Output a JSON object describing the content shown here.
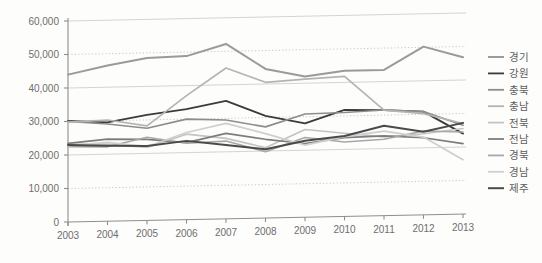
{
  "chart_data": {
    "type": "line",
    "title": "",
    "xlabel": "",
    "ylabel": "",
    "x": [
      "2003",
      "2004",
      "2005",
      "2006",
      "2007",
      "2008",
      "2009",
      "2010",
      "2011",
      "2012",
      "2013"
    ],
    "categories": [
      "2003",
      "2004",
      "2005",
      "2006",
      "2007",
      "2008",
      "2009",
      "2010",
      "2011",
      "2012",
      "2013"
    ],
    "ylim": [
      0,
      60000
    ],
    "ytick_values": [
      0,
      10000,
      20000,
      30000,
      40000,
      50000,
      60000
    ],
    "ytick_labels": [
      "0",
      "10,000",
      "20,000",
      "30,000",
      "40,000",
      "50,000",
      "60,000"
    ],
    "grid": true,
    "grid_note": "horizontal gridlines only; alternating solid and dotted",
    "legend_position": "right",
    "series": [
      {
        "name": "경기",
        "color": "#9a9a9a",
        "width": 2.0,
        "values": [
          44000,
          46500,
          48500,
          48800,
          52200,
          44500,
          42000,
          43500,
          43500,
          50200,
          46800
        ]
      },
      {
        "name": "강원",
        "color": "#3b3b3b",
        "width": 1.8,
        "values": [
          30200,
          29500,
          31500,
          33000,
          35200,
          30500,
          28000,
          31800,
          31500,
          30800,
          24000
        ]
      },
      {
        "name": "충북",
        "color": "#8d8d8d",
        "width": 1.6,
        "values": [
          30000,
          29000,
          27500,
          30000,
          29500,
          27200,
          30800,
          31000,
          31500,
          30800,
          26500
        ]
      },
      {
        "name": "충남",
        "color": "#b4b4b4",
        "width": 1.7,
        "values": [
          29800,
          30200,
          28200,
          37000,
          45000,
          40500,
          41200,
          41800,
          31500,
          30200,
          27000
        ]
      },
      {
        "name": "전북",
        "color": "#c4c4c4",
        "width": 1.6,
        "values": [
          23200,
          23000,
          21800,
          25500,
          24000,
          21000,
          26200,
          24800,
          23500,
          24200,
          25500
        ]
      },
      {
        "name": "전남",
        "color": "#7d7d7d",
        "width": 1.7,
        "values": [
          23500,
          24500,
          24200,
          23000,
          25500,
          23500,
          22000,
          23500,
          23800,
          23000,
          21000
        ]
      },
      {
        "name": "경북",
        "color": "#a8a8a8",
        "width": 1.6,
        "values": [
          22500,
          22200,
          24800,
          22800,
          23200,
          19800,
          23800,
          22200,
          22800,
          25000,
          24500
        ]
      },
      {
        "name": "경남",
        "color": "#cfcfcf",
        "width": 1.7,
        "values": [
          22800,
          23500,
          22000,
          26000,
          28500,
          25200,
          21500,
          23800,
          25200,
          23200,
          16200
        ]
      },
      {
        "name": "제주",
        "color": "#4a4a4a",
        "width": 2.0,
        "values": [
          23000,
          22500,
          22200,
          23500,
          22000,
          20500,
          22800,
          24000,
          26800,
          24800,
          27200
        ]
      }
    ]
  },
  "legend": {
    "items": [
      {
        "label": "경기"
      },
      {
        "label": "강원"
      },
      {
        "label": "충북"
      },
      {
        "label": "충남"
      },
      {
        "label": "전북"
      },
      {
        "label": "전남"
      },
      {
        "label": "경북"
      },
      {
        "label": "경남"
      },
      {
        "label": "제주"
      }
    ]
  },
  "colors": {
    "axis": "#8e8e8e",
    "grid_solid": "#c9c9c9",
    "grid_dotted": "#b9b9b9",
    "tick_text": "#6e6e6e",
    "legend_text": "#5d5d5d",
    "background": "#fdfdfc"
  }
}
